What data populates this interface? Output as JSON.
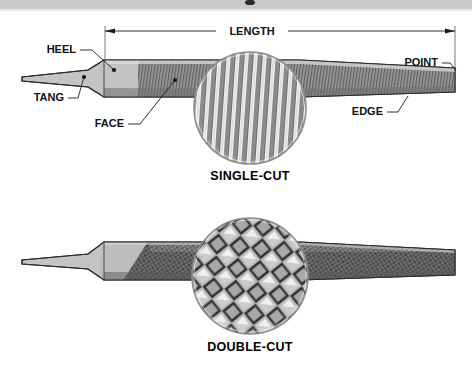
{
  "figure": {
    "title_top": "SINGLE-CUT",
    "title_bottom": "DOUBLE-CUT",
    "dimension_label": "LENGTH"
  },
  "labels": {
    "heel": "HEEL",
    "tang": "TANG",
    "face": "FACE",
    "edge": "EDGE",
    "point": "POINT"
  },
  "colors": {
    "background": "#ffffff",
    "top_band": "#c9c9c9",
    "outline": "#2b2b2b",
    "body_light": "#bdbdbd",
    "body_mid": "#9a9a9a",
    "body_dark": "#6f6f6f",
    "tooth_dark": "#4a4a4a",
    "text": "#111111",
    "leader": "#1a1a1a"
  },
  "diagram": {
    "type": "technical-illustration",
    "parts": [
      "TANG",
      "HEEL",
      "FACE",
      "EDGE",
      "POINT"
    ],
    "cut_patterns": [
      {
        "name": "SINGLE-CUT",
        "description": "parallel diagonal rows of teeth"
      },
      {
        "name": "DOUBLE-CUT",
        "description": "crossed diagonal rows forming diamond teeth"
      }
    ]
  }
}
